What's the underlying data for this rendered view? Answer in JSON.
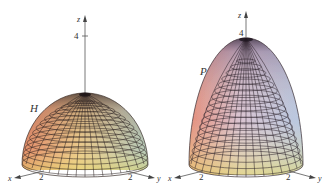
{
  "figures": [
    {
      "id": "hemisphere",
      "surface_label": "H",
      "axes": {
        "x": "x",
        "y": "y",
        "z": "z"
      },
      "ticks": {
        "z": "4",
        "x": "2",
        "y": "2"
      },
      "colors": {
        "top": "#3a2a30",
        "warm": "#e8806a",
        "mid": "#e9c88a",
        "cool": "#9fb8c0",
        "base": "#e6ea80"
      }
    },
    {
      "id": "paraboloid",
      "surface_label": "P",
      "axes": {
        "x": "x",
        "y": "y",
        "z": "z"
      },
      "ticks": {
        "z": "4",
        "x": "2",
        "y": "2"
      },
      "colors": {
        "top": "#3a2a3a",
        "warm": "#e89a90",
        "mid": "#d9c0d8",
        "cool": "#b8c8e0",
        "base": "#e8ea88"
      }
    }
  ]
}
